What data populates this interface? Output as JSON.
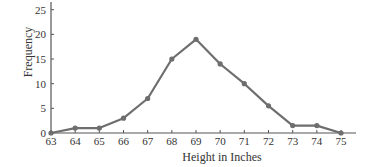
{
  "chart_data": {
    "type": "line",
    "title": "",
    "xlabel": "Height in Inches",
    "ylabel": "Frequency",
    "x": [
      63,
      64,
      65,
      66,
      67,
      68,
      69,
      70,
      71,
      72,
      73,
      74,
      75
    ],
    "series": [
      {
        "name": "Frequency",
        "values": [
          0,
          1,
          1,
          3,
          7,
          15,
          19,
          14,
          10,
          5.5,
          1.5,
          1.5,
          0
        ]
      }
    ],
    "xlim": [
      63,
      75
    ],
    "ylim": [
      0,
      25
    ],
    "xticks": [
      63,
      64,
      65,
      66,
      67,
      68,
      69,
      70,
      71,
      72,
      73,
      74,
      75
    ],
    "yticks": [
      0,
      5,
      10,
      15,
      20,
      25
    ],
    "grid": false,
    "legend": null,
    "marker": "circle",
    "line_color": "#6e6e6e",
    "axis_color": "#555555"
  }
}
